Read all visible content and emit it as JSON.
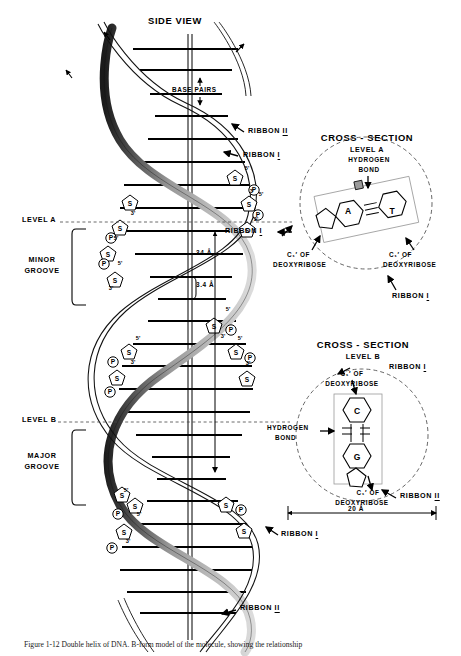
{
  "figure": {
    "title": "SIDE VIEW",
    "caption": "Figure 1-12  Double helix of DNA. B-form model of the molecule, showing the relationship"
  },
  "side_view": {
    "title": "SIDE VIEW",
    "base_pairs_label": "BASE PAIRS",
    "ribbon_two_top": "RIBBON",
    "ribbon_two_top_numeral": "II",
    "ribbon_one_top": "RIBBON",
    "ribbon_one_top_numeral": "I",
    "ribbon_one_mid": "RIBBON",
    "ribbon_one_mid_numeral": "I",
    "ribbon_one_bottom": "RIBBON",
    "ribbon_one_bottom_numeral": "I",
    "ribbon_two_bottom": "RIBBON",
    "ribbon_two_bottom_numeral": "II",
    "level_a": "LEVEL A",
    "level_b": "LEVEL B",
    "minor_groove": "MINOR\nGROOVE",
    "minor_groove_l1": "MINOR",
    "minor_groove_l2": "GROOVE",
    "major_groove_l1": "MAJOR",
    "major_groove_l2": "GROOVE",
    "pitch_measure": "34 Å",
    "rise_measure": "3.4 Å",
    "sugar_symbol": "S",
    "phosphate_symbol": "P",
    "five_prime": "5'",
    "three_prime": "3'"
  },
  "cross_section_a": {
    "title_line1": "CROSS - SECTION",
    "title_line2": "LEVEL A",
    "hydrogen_bond_l1": "HYDROGEN",
    "hydrogen_bond_l2": "BOND",
    "base_left": "A",
    "base_right": "T",
    "bond_glyph": "III",
    "c1_left_l1": "C₁′ OF",
    "c1_left_l2": "DEOXYRIBOSE",
    "c1_right_l1": "C₁′ OF",
    "c1_right_l2": "DEOXYRIBOSE",
    "ribbon_label": "RIBBON",
    "ribbon_numeral": "I",
    "ribbon_two_label": "RIBBON",
    "ribbon_two_numeral": "II"
  },
  "cross_section_b": {
    "title_line1": "CROSS - SECTION",
    "title_line2": "LEVEL B",
    "ribbon_one_label": "RIBBON",
    "ribbon_one_numeral": "I",
    "c1_top_l1": "C₁′ OF",
    "c1_top_l2": "DEOXYRIBOSE",
    "base_top": "C",
    "base_bottom": "G",
    "hydrogen_bond_l1": "HYDROGEN",
    "hydrogen_bond_l2": "BOND",
    "c1_bottom_l1": "C₁′ OF",
    "c1_bottom_l2": "DEOXYRIBOSE",
    "ribbon_two_label": "RIBBON",
    "ribbon_two_numeral": "II",
    "diameter_measure": "20 Å"
  },
  "colors": {
    "ink": "#000000",
    "ribbon_fill_light": "#d9d9d9",
    "ribbon_fill_mid": "#a8a8a8",
    "ribbon_edge": "#111111",
    "dashed": "#555555",
    "background": "#ffffff"
  }
}
